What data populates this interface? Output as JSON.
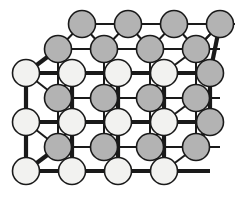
{
  "figure": {
    "name": "crystal-lattice-diagram",
    "type": "rock-salt-ionic-lattice",
    "background_color": "#ffffff",
    "outline_color": "#1a1a1a",
    "bond_color": "#1a1a1a",
    "front_bond_width": 4.2,
    "back_bond_width": 2.0,
    "circle_radius": 13.5,
    "circle_outline_width": 1.6
  },
  "species": [
    {
      "id": "light",
      "label": "light-ion",
      "fill": "#f2f2f0",
      "stroke": "#1a1a1a"
    },
    {
      "id": "dark",
      "label": "dark-ion",
      "fill": "#b3b3b3",
      "stroke": "#1a1a1a"
    }
  ],
  "geometry": {
    "column_spacing": 46,
    "row_spacing": 25,
    "back_offset_x": 24,
    "back_offset_y": -12,
    "front_origin_x": 26,
    "front_origin_y": 73,
    "front_columns": 4,
    "front_rows": 4,
    "back_columns": 4,
    "back_rows": 4
  },
  "chart_data": {
    "type": "scatter",
    "title": "",
    "xlabel": "",
    "ylabel": "",
    "grid": true,
    "legend": "none",
    "rows": [
      {
        "row": 0,
        "plane": "back",
        "species": "dark",
        "y": 24,
        "x": [
          82,
          128,
          174,
          220
        ],
        "count": 4
      },
      {
        "row": 1,
        "plane": "back",
        "species": "dark",
        "y": 49,
        "x": [
          58,
          104,
          150,
          196
        ],
        "count": 4
      },
      {
        "row": 2,
        "plane": "front",
        "species": "light",
        "y": 73,
        "x": [
          26,
          72,
          118,
          164
        ],
        "count": 4
      },
      {
        "row": 3,
        "plane": "back",
        "species": "dark",
        "y": 98,
        "x": [
          58,
          104,
          150,
          196
        ],
        "count": 4
      },
      {
        "row": 4,
        "plane": "front",
        "species": "light",
        "y": 122,
        "x": [
          26,
          72,
          118,
          164
        ],
        "count": 4
      },
      {
        "row": 5,
        "plane": "back",
        "species": "dark",
        "y": 147,
        "x": [
          58,
          104,
          150,
          196
        ],
        "count": 4
      },
      {
        "row": 6,
        "plane": "front",
        "species": "light",
        "y": 171,
        "x": [
          26,
          72,
          118,
          164
        ],
        "count": 4
      }
    ],
    "right_edge_column": {
      "plane": "front",
      "species": "dark",
      "x": 210,
      "y": [
        73,
        122
      ],
      "count": 2
    },
    "total_atoms": 30,
    "light_atom_count": 12,
    "dark_atom_count": 18
  }
}
